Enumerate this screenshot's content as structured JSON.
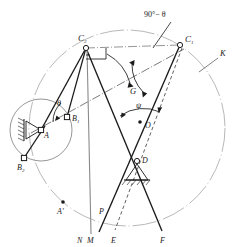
{
  "figure": {
    "type": "kinematic-linkage-diagram",
    "title": "",
    "background_color": "#ffffff",
    "ink_color": "#1a1a1a",
    "light_ink_color": "#8a8a8a",
    "width": 240,
    "height": 247
  },
  "labels": {
    "c1": "C",
    "c1_sub": "1",
    "c2": "C",
    "c2_sub": "2",
    "b1": "B",
    "b1_sub": "1",
    "b2": "B",
    "b2_sub": "2",
    "a": "A",
    "a_prime": "A'",
    "d": "D",
    "o": "O",
    "g": "G",
    "k": "K",
    "n": "N",
    "m": "M",
    "p": "P",
    "e": "E",
    "f": "F",
    "theta": "θ",
    "psi": "ψ",
    "angle_90_minus_theta": "90°− θ"
  },
  "nodes": [
    {
      "name": "C2",
      "x": 86,
      "y": 48,
      "marker": "open-circle"
    },
    {
      "name": "C1",
      "x": 180,
      "y": 45,
      "marker": "open-circle"
    },
    {
      "name": "B1",
      "x": 67,
      "y": 117,
      "marker": "open-square"
    },
    {
      "name": "B2",
      "x": 24,
      "y": 158,
      "marker": "open-square"
    },
    {
      "name": "A",
      "x": 41,
      "y": 130,
      "marker": "open-square"
    },
    {
      "name": "D",
      "x": 137,
      "y": 161,
      "marker": "open-circle"
    },
    {
      "name": "O",
      "x": 140,
      "y": 122,
      "marker": "filled-dot"
    },
    {
      "name": "A'",
      "x": 63,
      "y": 205,
      "marker": "filled-dot"
    }
  ],
  "circles": [
    {
      "name": "K",
      "cx": 127,
      "cy": 128,
      "r": 98,
      "style": "light-dashdot"
    },
    {
      "name": "crank-circle-A",
      "cx": 41,
      "cy": 130,
      "r": 31,
      "style": "light-solid"
    }
  ],
  "angles": {
    "theta_value_label": "θ",
    "psi_value_label": "ψ",
    "callout_label": "90°− θ"
  },
  "line_styles": {
    "solid_heavy": "solid",
    "dash_dot": "dash-dot",
    "dashed": "dashed",
    "light": "light"
  }
}
